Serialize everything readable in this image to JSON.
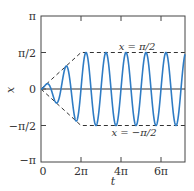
{
  "chart_data": {
    "type": "line",
    "title": "",
    "xlabel": "t",
    "ylabel": "x",
    "xlim_over_pi": [
      0,
      7.2
    ],
    "ylim_over_pi": [
      -1,
      1
    ],
    "xticks": [
      {
        "value_over_pi": 0,
        "label": "0"
      },
      {
        "value_over_pi": 2,
        "label": "2π"
      },
      {
        "value_over_pi": 4,
        "label": "4π"
      },
      {
        "value_over_pi": 6,
        "label": "6π"
      }
    ],
    "yticks": [
      {
        "value_over_pi": 1,
        "label": "π"
      },
      {
        "value_over_pi": 0.5,
        "label": "π/2"
      },
      {
        "value_over_pi": 0,
        "label": "0"
      },
      {
        "value_over_pi": -0.5,
        "label": "−π/2"
      },
      {
        "value_over_pi": -1,
        "label": "−π"
      }
    ],
    "series": [
      {
        "name": "x(t)",
        "description": "oscillation sin(2t) with amplitude growing linearly from 0 at t=0 to π/2 at t=2π, then constant π/2",
        "angular_frequency": 2,
        "amplitude_ramp_end_over_pi": 2,
        "amplitude_final_over_pi": 0.5,
        "color": "#2f7cc4"
      }
    ],
    "envelope": {
      "upper": {
        "points_over_pi": [
          [
            0,
            0
          ],
          [
            2,
            0.5
          ],
          [
            7.2,
            0.5
          ]
        ],
        "style": "dashed"
      },
      "lower": {
        "points_over_pi": [
          [
            0,
            0
          ],
          [
            2,
            -0.5
          ],
          [
            7.2,
            -0.5
          ]
        ],
        "style": "dashed"
      }
    },
    "reference_lines": [
      {
        "y_over_pi": 0,
        "style": "solid"
      }
    ],
    "annotations": [
      {
        "text": "x = π/2",
        "near": "upper envelope, above"
      },
      {
        "text": "x = −π/2",
        "near": "lower envelope, below"
      }
    ],
    "grid": false,
    "legend": "none"
  }
}
